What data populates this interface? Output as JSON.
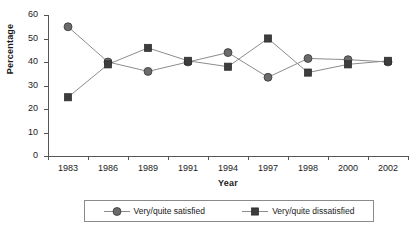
{
  "chart_data": {
    "type": "line",
    "title": "",
    "xlabel": "Year",
    "ylabel": "Percentage",
    "categories": [
      "1983",
      "1986",
      "1989",
      "1991",
      "1994",
      "1997",
      "1998",
      "2000",
      "2002"
    ],
    "ylim": [
      0,
      60
    ],
    "yticks": [
      0,
      10,
      20,
      30,
      40,
      50,
      60
    ],
    "ytick_labels": [
      "0",
      "10",
      "20",
      "30",
      "40",
      "50",
      "60"
    ],
    "grid": false,
    "legend_position": "bottom",
    "series": [
      {
        "name": "Very/quite satisfied",
        "marker": "circle",
        "color": "#6b6b6b",
        "values": [
          55,
          40,
          36,
          40,
          44,
          33.5,
          41.5,
          41,
          40
        ]
      },
      {
        "name": "Very/quite dissatisfied",
        "marker": "square",
        "color": "#3d3d3d",
        "values": [
          25,
          39,
          46,
          40.5,
          38,
          50,
          35.5,
          39,
          40.5
        ]
      }
    ]
  },
  "axes": {
    "y_title": "Percentage",
    "x_title": "Year"
  },
  "legend": {
    "entries": [
      {
        "label": "Very/quite satisfied",
        "marker": "circle-marker-icon"
      },
      {
        "label": "Very/quite dissatisfied",
        "marker": "square-marker-icon"
      }
    ]
  }
}
